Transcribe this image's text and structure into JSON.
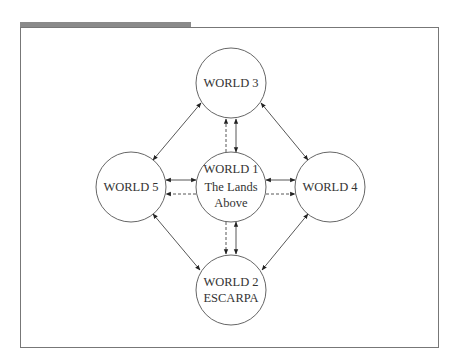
{
  "diagram": {
    "header_bar_color": "#8a8a8a",
    "frame_color": "#777777",
    "nodes": [
      {
        "id": "w1",
        "lines": [
          "WORLD 1",
          "The Lands",
          "Above"
        ],
        "cx": 231,
        "cy": 187
      },
      {
        "id": "w2",
        "lines": [
          "WORLD 2",
          "ESCARPA"
        ],
        "cx": 231,
        "cy": 290
      },
      {
        "id": "w3",
        "lines": [
          "WORLD 3"
        ],
        "cx": 231,
        "cy": 83
      },
      {
        "id": "w4",
        "lines": [
          "WORLD 4"
        ],
        "cx": 330,
        "cy": 187
      },
      {
        "id": "w5",
        "lines": [
          "WORLD 5"
        ],
        "cx": 131,
        "cy": 187
      }
    ],
    "edges": [
      {
        "from": "w3",
        "to": "w5",
        "style": "solid",
        "heads": "both"
      },
      {
        "from": "w3",
        "to": "w4",
        "style": "solid",
        "heads": "both"
      },
      {
        "from": "w2",
        "to": "w5",
        "style": "solid",
        "heads": "both"
      },
      {
        "from": "w2",
        "to": "w4",
        "style": "solid",
        "heads": "both"
      },
      {
        "from": "w1",
        "to": "w3",
        "style": "solid",
        "heads": "both"
      },
      {
        "from": "w1",
        "to": "w3",
        "style": "dashed",
        "heads": "to"
      },
      {
        "from": "w1",
        "to": "w2",
        "style": "solid",
        "heads": "both"
      },
      {
        "from": "w1",
        "to": "w2",
        "style": "dashed",
        "heads": "to"
      },
      {
        "from": "w1",
        "to": "w5",
        "style": "solid",
        "heads": "both"
      },
      {
        "from": "w1",
        "to": "w5",
        "style": "dashed",
        "heads": "to"
      },
      {
        "from": "w1",
        "to": "w4",
        "style": "solid",
        "heads": "both"
      },
      {
        "from": "w1",
        "to": "w4",
        "style": "dashed",
        "heads": "to"
      }
    ]
  }
}
